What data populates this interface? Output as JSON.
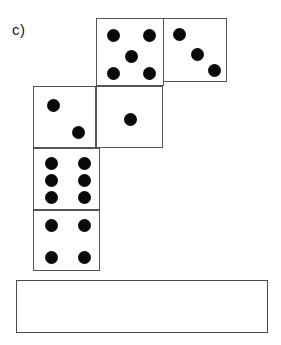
{
  "figure": {
    "label": "c)",
    "label_x": 12,
    "label_y": 22,
    "width": 281,
    "height": 345,
    "background_color": "#ffffff",
    "die_border_color": "#555555",
    "pip_color": "#0a0a0a",
    "answer_box_border_color": "#4a4a4a"
  },
  "dice": [
    {
      "name": "die-five",
      "value": 5,
      "x": 96,
      "y": 18,
      "width": 68,
      "height": 68,
      "pip_radius": 6.5,
      "pips": [
        {
          "cx": 16,
          "cy": 16
        },
        {
          "cx": 52,
          "cy": 16
        },
        {
          "cx": 34,
          "cy": 37
        },
        {
          "cx": 16,
          "cy": 54
        },
        {
          "cx": 52,
          "cy": 54
        }
      ]
    },
    {
      "name": "die-three",
      "value": 3,
      "x": 163,
      "y": 18,
      "width": 64,
      "height": 64,
      "pip_radius": 6.5,
      "pips": [
        {
          "cx": 15,
          "cy": 15
        },
        {
          "cx": 33,
          "cy": 35
        },
        {
          "cx": 50,
          "cy": 51
        }
      ]
    },
    {
      "name": "die-two",
      "value": 2,
      "x": 33,
      "y": 86,
      "width": 63,
      "height": 62,
      "pip_radius": 6.5,
      "pips": [
        {
          "cx": 19,
          "cy": 18
        },
        {
          "cx": 44,
          "cy": 45
        }
      ]
    },
    {
      "name": "die-one",
      "value": 1,
      "x": 96,
      "y": 86,
      "width": 67,
      "height": 62,
      "pip_radius": 6.5,
      "pips": [
        {
          "cx": 33,
          "cy": 32
        }
      ]
    },
    {
      "name": "die-six",
      "value": 6,
      "x": 33,
      "y": 148,
      "width": 67,
      "height": 62,
      "pip_radius": 6.5,
      "pips": [
        {
          "cx": 17,
          "cy": 14
        },
        {
          "cx": 50,
          "cy": 14
        },
        {
          "cx": 17,
          "cy": 31
        },
        {
          "cx": 50,
          "cy": 31
        },
        {
          "cx": 17,
          "cy": 48
        },
        {
          "cx": 50,
          "cy": 48
        }
      ]
    },
    {
      "name": "die-four",
      "value": 4,
      "x": 33,
      "y": 210,
      "width": 67,
      "height": 61,
      "pip_radius": 6.5,
      "pips": [
        {
          "cx": 17,
          "cy": 14
        },
        {
          "cx": 50,
          "cy": 14
        },
        {
          "cx": 17,
          "cy": 46
        },
        {
          "cx": 50,
          "cy": 46
        }
      ]
    }
  ],
  "answer_box": {
    "name": "answer-box",
    "x": 16,
    "y": 280,
    "width": 252,
    "height": 53,
    "value": ""
  }
}
